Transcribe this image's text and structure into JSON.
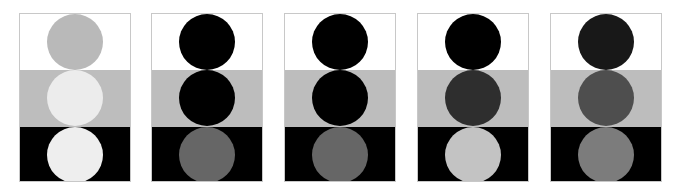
{
  "figure": {
    "band_colors": [
      "#ffffff",
      "#bdbdbd",
      "#000000"
    ],
    "panels": [
      {
        "id": 1,
        "circle_colors": [
          "#b9b9b9",
          "#ececec",
          "#eeeeee"
        ]
      },
      {
        "id": 2,
        "circle_colors": [
          "#000000",
          "#000000",
          "#666666"
        ]
      },
      {
        "id": 3,
        "circle_colors": [
          "#000000",
          "#000000",
          "#666666"
        ]
      },
      {
        "id": 4,
        "circle_colors": [
          "#000000",
          "#2e2e2e",
          "#c3c3c3"
        ]
      },
      {
        "id": 5,
        "circle_colors": [
          "#181818",
          "#4e4e4e",
          "#7c7c7c"
        ]
      }
    ]
  }
}
